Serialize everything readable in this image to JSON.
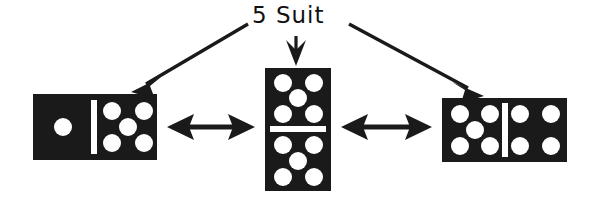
{
  "figure": {
    "title": "5 Suit",
    "label": "5 Suit",
    "ink_color": "#1a1a1a",
    "pip_color": "#ffffff",
    "background_color": "#ffffff"
  },
  "dominoes": [
    {
      "id": "left-domino",
      "name": "domino-1-5",
      "orientation": "horizontal",
      "halves": [
        1,
        5
      ],
      "value_text": "1-5",
      "x": 33,
      "y": 94,
      "w": 124,
      "h": 66
    },
    {
      "id": "center-domino",
      "name": "domino-5-5",
      "orientation": "vertical",
      "halves": [
        5,
        5
      ],
      "value_text": "5-5",
      "x": 265,
      "y": 68,
      "w": 66,
      "h": 123
    },
    {
      "id": "right-domino",
      "name": "domino-5-4",
      "orientation": "horizontal",
      "halves": [
        5,
        4
      ],
      "value_text": "5-4",
      "x": 442,
      "y": 98,
      "w": 125,
      "h": 64
    }
  ],
  "connectors": [
    {
      "id": "connector-left",
      "name": "double-arrow-left-center",
      "type": "double-headed-arrow",
      "from": "domino-1-5",
      "to": "domino-5-5",
      "x1": 167,
      "y1": 127,
      "x2": 255,
      "y2": 127
    },
    {
      "id": "connector-right",
      "name": "double-arrow-center-right",
      "type": "double-headed-arrow",
      "from": "domino-5-5",
      "to": "domino-5-4",
      "x1": 341,
      "y1": 127,
      "x2": 432,
      "y2": 127
    }
  ],
  "pointers": [
    {
      "id": "pointer-left",
      "name": "label-arrow-to-left-domino",
      "type": "single-headed-arrow",
      "target": "domino-1-5",
      "x1": 246,
      "y1": 24,
      "x2": 134,
      "y2": 89
    },
    {
      "id": "pointer-center",
      "name": "label-arrow-to-center-domino",
      "type": "single-headed-arrow",
      "target": "domino-5-5",
      "x1": 296,
      "y1": 38,
      "x2": 296,
      "y2": 64
    },
    {
      "id": "pointer-right",
      "name": "label-arrow-to-right-domino",
      "type": "single-headed-arrow",
      "target": "domino-5-4",
      "x1": 350,
      "y1": 24,
      "x2": 482,
      "y2": 93
    }
  ]
}
